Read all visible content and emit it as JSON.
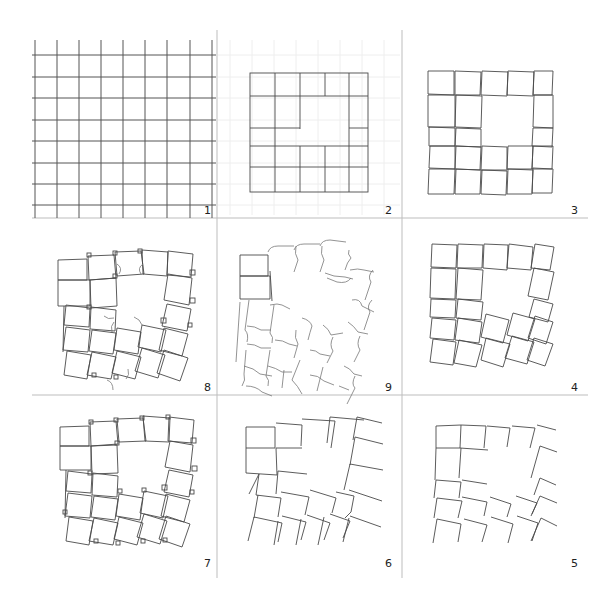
{
  "figure": {
    "panels": [
      {
        "id": 1,
        "label": "1",
        "content": "regular square grid"
      },
      {
        "id": 2,
        "label": "2",
        "content": "5x5 tile block with central void on faint grid"
      },
      {
        "id": 3,
        "label": "3",
        "content": "tiles slightly separated and rotated"
      },
      {
        "id": 4,
        "label": "4",
        "content": "tiles increasingly rotated"
      },
      {
        "id": 5,
        "label": "5",
        "content": "tiles reduced to two-sided corner fragments"
      },
      {
        "id": 6,
        "label": "6",
        "content": "corner fragments with extended edges"
      },
      {
        "id": 7,
        "label": "7",
        "content": "rotated tiles with small overlap squares"
      },
      {
        "id": 8,
        "label": "8",
        "content": "overlapping tiles with curved connectors"
      },
      {
        "id": 9,
        "label": "9",
        "content": "curved bracket fragments"
      }
    ]
  },
  "labels": {
    "p1": "1",
    "p2": "2",
    "p3": "3",
    "p4": "4",
    "p5": "5",
    "p6": "6",
    "p7": "7",
    "p8": "8",
    "p9": "9"
  }
}
